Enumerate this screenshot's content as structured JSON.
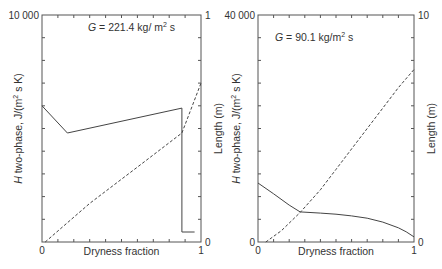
{
  "chart_data": [
    {
      "type": "line",
      "annotation": "G = 221.4 kg/ m² s",
      "annotation_parts": {
        "var": "G",
        "eq": " = 221.4 kg/ m",
        "sup": "2",
        "tail": " s"
      },
      "xlabel": "Dryness fraction",
      "ylabel": "H two-phase, J/(m² s  K)",
      "ylabel_parts": {
        "var": "H",
        "rest": " two-phase, J/(m",
        "sup": "2",
        "tail": " s  K)"
      },
      "y2label": "Length (m)",
      "xlim": [
        0,
        1
      ],
      "ylim": [
        0,
        10000
      ],
      "y2lim": [
        0,
        1
      ],
      "x_tick_labels": {
        "min": "0",
        "max": "1"
      },
      "y_tick_labels": {
        "max": "10 000"
      },
      "y2_tick_labels": {
        "min": "0",
        "max": "1"
      },
      "grid": false,
      "series": [
        {
          "name": "H two-phase",
          "axis": "left",
          "style": "solid",
          "x": [
            0.0,
            0.16,
            0.88,
            0.88,
            0.96
          ],
          "y": [
            6000,
            4800,
            5900,
            440,
            440
          ]
        },
        {
          "name": "Length",
          "axis": "right",
          "style": "dashed",
          "x": [
            0.02,
            0.3,
            0.6,
            0.88,
            1.0
          ],
          "y": [
            0.0,
            0.17,
            0.33,
            0.48,
            0.7
          ]
        }
      ]
    },
    {
      "type": "line",
      "annotation": "G = 90.1 kg/m² s",
      "annotation_parts": {
        "var": "G",
        "eq": " = 90.1 kg/m",
        "sup": "2",
        "tail": " s"
      },
      "xlabel": "Dryness fraction",
      "ylabel": "H two-phase, J/(m² s K)",
      "ylabel_parts": {
        "var": "H",
        "rest": " two-phase, J/(m",
        "sup": "2",
        "tail": " s K)"
      },
      "y2label": "Length (m)",
      "xlim": [
        0,
        1
      ],
      "ylim": [
        0,
        40000
      ],
      "y2lim": [
        0,
        10
      ],
      "x_tick_labels": {
        "min": "0",
        "max": "1"
      },
      "y_tick_labels": {
        "min": "0",
        "max": "40 000"
      },
      "y2_tick_labels": {
        "min": "0",
        "max": "10"
      },
      "grid": false,
      "series": [
        {
          "name": "H two-phase",
          "axis": "left",
          "style": "solid",
          "x": [
            0.0,
            0.1,
            0.2,
            0.27,
            0.4,
            0.5,
            0.6,
            0.7,
            0.8,
            0.9,
            0.95,
            1.0
          ],
          "y": [
            10400,
            8500,
            6500,
            5300,
            5100,
            4900,
            4600,
            4200,
            3500,
            2500,
            1800,
            900
          ]
        },
        {
          "name": "Length",
          "axis": "right",
          "style": "dashed",
          "x": [
            0.05,
            0.15,
            0.27,
            0.4,
            0.5,
            0.6,
            0.7,
            0.8,
            0.9,
            1.0
          ],
          "y": [
            0.0,
            0.5,
            1.3,
            2.3,
            3.2,
            4.1,
            5.0,
            5.9,
            6.8,
            7.6
          ]
        }
      ]
    }
  ]
}
